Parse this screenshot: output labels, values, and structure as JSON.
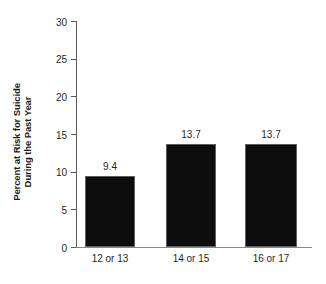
{
  "chart_data": {
    "type": "bar",
    "title": "",
    "subtitle": "",
    "xlabel": "",
    "ylabel": "Percent at Risk for Suicide During the Past Year",
    "ylabel_lines": [
      "Percent at Risk for Suicide",
      "During the Past Year"
    ],
    "categories": [
      "12 or 13",
      "14 or 15",
      "16 or 17"
    ],
    "values": [
      9.4,
      13.7,
      13.7
    ],
    "value_labels": [
      "9.4",
      "13.7",
      "13.7"
    ],
    "ylim": [
      0,
      30
    ],
    "yticks": [
      0,
      5,
      10,
      15,
      20,
      25,
      30
    ],
    "ytick_labels": [
      "0",
      "5",
      "10",
      "15",
      "20",
      "25",
      "30"
    ],
    "grid": false,
    "legend": false,
    "legend_position": "none",
    "bar_color": "#0d0d0d",
    "bar_edge_color": "#5f5f5f",
    "axis_color": "#5a5a5a",
    "text_color": "#1f1f1f",
    "background_color": "#ffffff"
  }
}
